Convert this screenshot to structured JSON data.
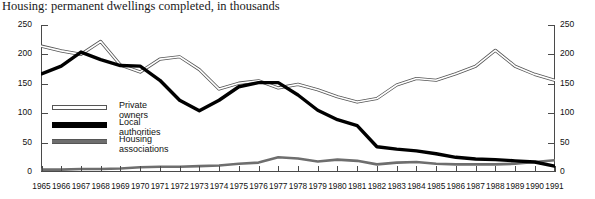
{
  "chart_data": {
    "type": "line",
    "title": "Housing: permanent dwellings completed, in thousands",
    "xlabel": "",
    "ylabel": "",
    "ylim": [
      0,
      250
    ],
    "yticks": [
      0,
      50,
      100,
      150,
      200,
      250
    ],
    "grid": false,
    "legend_position": "inside-left",
    "dual_y_axis": true,
    "categories": [
      "1965",
      "1966",
      "1967",
      "1968",
      "1969",
      "1970",
      "1971",
      "1972",
      "1973",
      "1974",
      "1975",
      "1976",
      "1977",
      "1978",
      "1979",
      "1980",
      "1981",
      "1982",
      "1983",
      "1984",
      "1985",
      "1986",
      "1987",
      "1988",
      "1989",
      "1990",
      "1991"
    ],
    "series": [
      {
        "name": "Private owners",
        "color": "#ffffff",
        "outline": "#555555",
        "values": [
          214,
          206,
          200,
          222,
          182,
          170,
          192,
          196,
          174,
          141,
          151,
          155,
          143,
          149,
          140,
          128,
          119,
          125,
          148,
          159,
          156,
          167,
          180,
          207,
          180,
          166,
          156
        ]
      },
      {
        "name": "Local authorities",
        "color": "#000000",
        "values": [
          167,
          180,
          204,
          191,
          181,
          180,
          156,
          122,
          104,
          122,
          145,
          152,
          152,
          131,
          105,
          89,
          79,
          43,
          39,
          36,
          31,
          25,
          22,
          21,
          19,
          17,
          10
        ]
      },
      {
        "name": "Housing associations",
        "color": "#6e6e6e",
        "values": [
          4,
          4,
          5,
          5,
          6,
          8,
          9,
          9,
          10,
          11,
          14,
          16,
          25,
          23,
          18,
          21,
          19,
          13,
          16,
          17,
          14,
          13,
          13,
          13,
          14,
          17,
          20
        ]
      }
    ]
  },
  "axis": {
    "left_ticks": [
      "250",
      "200",
      "150",
      "100",
      "50",
      "0"
    ],
    "right_ticks": [
      "250",
      "200",
      "150",
      "100",
      "50",
      "0"
    ]
  },
  "legend": {
    "items": [
      {
        "label": "Private owners"
      },
      {
        "label": "Local authorities"
      },
      {
        "label": "Housing associations"
      }
    ]
  }
}
